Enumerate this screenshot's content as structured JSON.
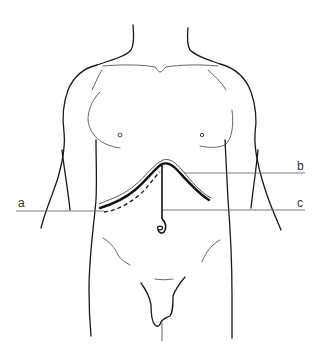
{
  "figure": {
    "labels": {
      "a": "a",
      "b": "b",
      "c": "c"
    },
    "annotations": [
      {
        "key": "a",
        "points_to": "dashed incision line (lower left)"
      },
      {
        "key": "b",
        "points_to": "double curved incision line (upper)"
      },
      {
        "key": "c",
        "points_to": "vertical midline incision to umbilicus"
      }
    ],
    "colors": {
      "line": "#1a1a1a",
      "background": "#ffffff",
      "label": "#333333"
    }
  }
}
